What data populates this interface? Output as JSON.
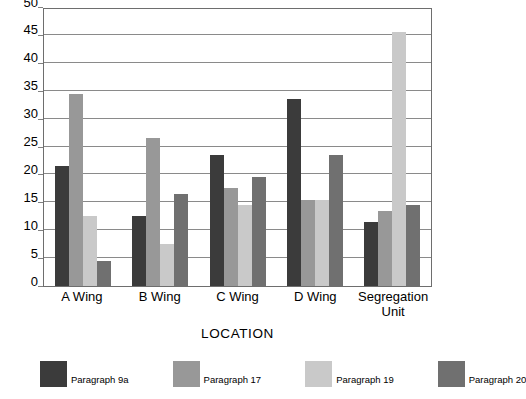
{
  "chart_data": {
    "type": "bar",
    "title": "",
    "xlabel": "LOCATION",
    "ylabel": "",
    "ylim": [
      0,
      50
    ],
    "ytick_step": 5,
    "yticks": [
      0,
      5,
      10,
      15,
      20,
      25,
      30,
      35,
      40,
      45,
      50
    ],
    "grid": true,
    "grid_axis": "y",
    "legend_position": "bottom",
    "categories": [
      "A Wing",
      "B Wing",
      "C Wing",
      "D Wing",
      "Segregation\nUnit"
    ],
    "category_labels_plain": [
      "A Wing",
      "B Wing",
      "C Wing",
      "D Wing",
      "Segregation Unit"
    ],
    "series": [
      {
        "name": "Paragraph 9a",
        "color": "#3b3b3b",
        "values": [
          21.5,
          12.5,
          23.5,
          33.5,
          11.5
        ]
      },
      {
        "name": "Paragraph 17",
        "color": "#989898",
        "values": [
          34.5,
          26.5,
          17.5,
          15.5,
          13.5
        ]
      },
      {
        "name": "Paragraph 19",
        "color": "#c9c9c9",
        "values": [
          12.5,
          7.5,
          14.5,
          15.5,
          45.5
        ]
      },
      {
        "name": "Paragraph 20",
        "color": "#707070",
        "values": [
          4.5,
          16.5,
          19.5,
          23.5,
          14.5
        ]
      }
    ]
  },
  "axis": {
    "x_title": "LOCATION"
  },
  "legend": {
    "items": [
      {
        "label": "Paragraph 9a",
        "color": "#3b3b3b"
      },
      {
        "label": "Paragraph 17",
        "color": "#989898"
      },
      {
        "label": "Paragraph 19",
        "color": "#c9c9c9"
      },
      {
        "label": "Paragraph 20",
        "color": "#707070"
      }
    ]
  },
  "style": {
    "plot_border_color": "#6e6e6e",
    "gridline_color": "#8a8a8a",
    "background": "#ffffff",
    "text_color": "#000000"
  }
}
